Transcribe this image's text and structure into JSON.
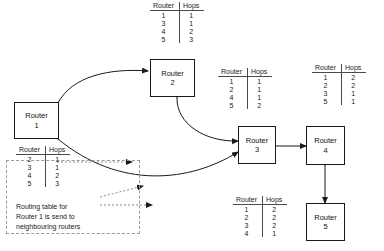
{
  "diagram": {
    "routers": [
      {
        "id": "router-1",
        "label_line1": "Router",
        "label_line2": "1"
      },
      {
        "id": "router-2",
        "label_line1": "Router",
        "label_line2": "2"
      },
      {
        "id": "router-3",
        "label_line1": "Router",
        "label_line2": "3"
      },
      {
        "id": "router-4",
        "label_line1": "Router",
        "label_line2": "4"
      },
      {
        "id": "router-5",
        "label_line1": "Router",
        "label_line2": "5"
      }
    ],
    "table_headers": {
      "router": "Router",
      "hops": "Hops"
    },
    "tables": [
      {
        "id": "table-router-2",
        "rows": [
          {
            "router": "1",
            "hops": "1"
          },
          {
            "router": "3",
            "hops": "1"
          },
          {
            "router": "4",
            "hops": "2"
          },
          {
            "router": "5",
            "hops": "3"
          }
        ]
      },
      {
        "id": "table-router-1",
        "rows": [
          {
            "router": "2",
            "hops": "1"
          },
          {
            "router": "3",
            "hops": "1"
          },
          {
            "router": "4",
            "hops": "2"
          },
          {
            "router": "5",
            "hops": "3"
          }
        ]
      },
      {
        "id": "table-router-3",
        "rows": [
          {
            "router": "1",
            "hops": "1"
          },
          {
            "router": "2",
            "hops": "1"
          },
          {
            "router": "4",
            "hops": "1"
          },
          {
            "router": "5",
            "hops": "2"
          }
        ]
      },
      {
        "id": "table-router-4",
        "rows": [
          {
            "router": "1",
            "hops": "2"
          },
          {
            "router": "2",
            "hops": "2"
          },
          {
            "router": "3",
            "hops": "1"
          },
          {
            "router": "5",
            "hops": "1"
          }
        ]
      },
      {
        "id": "table-router-5",
        "rows": [
          {
            "router": "1",
            "hops": "2"
          },
          {
            "router": "2",
            "hops": "2"
          },
          {
            "router": "3",
            "hops": "2"
          },
          {
            "router": "4",
            "hops": "1"
          }
        ]
      }
    ],
    "caption": {
      "line1": "Routing table for",
      "line2": "Router 1 is send to",
      "line3": "neighbouring routers"
    },
    "colors": {
      "line": "#1a1a1a",
      "table_rule": "#4a4a4a",
      "dashed": "#9a9a9a",
      "background": "#ffffff"
    }
  }
}
